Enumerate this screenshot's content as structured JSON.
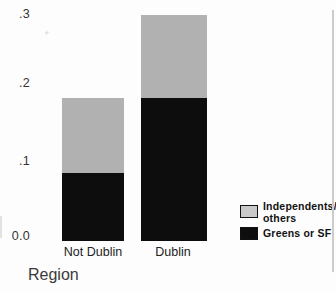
{
  "chart_data": {
    "type": "bar",
    "stacked": true,
    "title": "",
    "categories": [
      "Not Dublin",
      "Dublin"
    ],
    "series": [
      {
        "name": "Greens or SF",
        "color": "#0d0d0d",
        "values": [
          0.09,
          0.19
        ]
      },
      {
        "name": "Independents/others",
        "color": "#b1b1b1",
        "values": [
          0.1,
          0.11
        ]
      }
    ],
    "xlabel": "Region",
    "ylabel": "",
    "ylim": [
      0,
      0.3
    ],
    "ytick_labels": [
      "0.0",
      ".1",
      ".2",
      ".3"
    ],
    "ytick_values": [
      0,
      0.1,
      0.2,
      0.3
    ],
    "grid": false,
    "legend_position": "right"
  },
  "legend": {
    "items": [
      {
        "line1": "Independents/",
        "line2": "others",
        "swatch_color": "#c9c9c9"
      },
      {
        "line1": "Greens or SF",
        "swatch_color": "#0e0e0e"
      }
    ]
  },
  "artifacts": {
    "plus_mark": "+"
  }
}
